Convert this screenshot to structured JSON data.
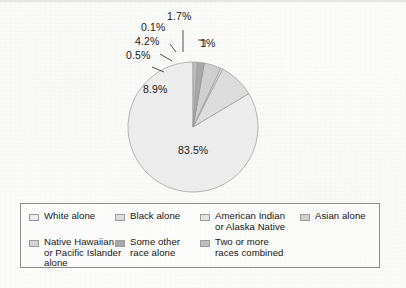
{
  "chart_data": {
    "type": "pie",
    "title": "",
    "subtitle": "",
    "xlabel": "",
    "ylabel": "",
    "legend_position": "bottom",
    "grid": false,
    "start_angle_deg": 90,
    "direction": "counterclockwise",
    "categories": [
      "White alone",
      "Black alone",
      "American Indian or Alaska Native",
      "Asian alone",
      "Native Hawaiian or Pacific Islander alone",
      "Some other race alone",
      "Two or more races combined"
    ],
    "values": [
      83.5,
      8.9,
      0.5,
      4.2,
      0.1,
      1.7,
      1.0
    ],
    "value_labels": [
      "83.5%",
      "8.9%",
      "0.5%",
      "4.2%",
      "0.1%",
      "1.7%",
      "1%"
    ],
    "colors": [
      "#ececec",
      "#dcdcdc",
      "#e3e3e3",
      "#cfcfcf",
      "#d4d4d4",
      "#a8a8a8",
      "#bdbdbd"
    ]
  },
  "slice_labels": [
    {
      "text": "0.1%",
      "name": "slice-label-native-hawaiian"
    },
    {
      "text": "1.7%",
      "name": "slice-label-some-other-race"
    },
    {
      "text": "4.2%",
      "name": "slice-label-asian"
    },
    {
      "text": "1%",
      "name": "slice-label-two-or-more"
    },
    {
      "text": "0.5%",
      "name": "slice-label-american-indian"
    },
    {
      "text": "8.9%",
      "name": "slice-label-black"
    },
    {
      "text": "83.5%",
      "name": "slice-label-white"
    }
  ],
  "legend": {
    "items": [
      {
        "label": "White alone",
        "color": "#ececec"
      },
      {
        "label": "Black alone",
        "color": "#dcdcdc"
      },
      {
        "label": "American Indian\nor Alaska Native",
        "color": "#e3e3e3"
      },
      {
        "label": "Asian alone",
        "color": "#cfcfcf"
      },
      {
        "label": "Native Hawaiian\nor Pacific Islander\nalone",
        "color": "#d4d4d4"
      },
      {
        "label": "Some other\nrace alone",
        "color": "#a8a8a8"
      },
      {
        "label": "Two or more\nraces combined",
        "color": "#bdbdbd"
      }
    ]
  },
  "style": {
    "border_color": "#8d8d8d",
    "text_color": "#1a1a1a",
    "background": "#fbfbfa"
  }
}
